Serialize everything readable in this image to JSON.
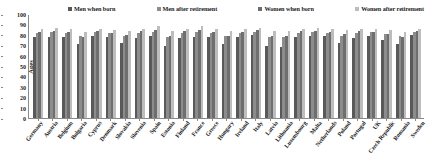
{
  "chart_data": {
    "type": "bar",
    "title": "",
    "xlabel": "",
    "ylabel": "Ages",
    "ylim": [
      0,
      100
    ],
    "yticks": [
      100,
      90,
      80,
      70,
      60,
      50,
      40,
      30,
      20,
      10,
      0
    ],
    "grid": false,
    "legend_position": "top",
    "categories": [
      "Germany",
      "Austria",
      "Belgium",
      "Bulgaria",
      "Cyprus",
      "Denmark",
      "Slovakia",
      "Slovenia",
      "Spain",
      "Estonia",
      "Finland",
      "France",
      "Greece",
      "Hungary",
      "Ireland",
      "Italy",
      "Latvia",
      "Lithuania",
      "Luxembourg",
      "Malta",
      "Netherlands",
      "Poland",
      "Portugal",
      "UK",
      "Czech Republic",
      "Romania",
      "Sweden"
    ],
    "series": [
      {
        "name": "Men when born",
        "color": "#595959",
        "values": [
          78,
          78,
          78,
          71,
          79,
          78,
          72,
          77,
          79,
          69,
          77,
          78,
          78,
          71,
          78,
          80,
          69,
          68,
          78,
          79,
          79,
          72,
          77,
          79,
          75,
          71,
          80
        ]
      },
      {
        "name": "Men after retirement",
        "color": "#8c8c8c",
        "values": [
          82,
          83,
          82,
          79,
          83,
          82,
          79,
          82,
          83,
          78,
          82,
          83,
          82,
          79,
          82,
          83,
          78,
          78,
          82,
          83,
          82,
          79,
          82,
          83,
          81,
          79,
          83
        ]
      },
      {
        "name": "Women when born",
        "color": "#6e6e6e",
        "values": [
          83,
          84,
          83,
          78,
          84,
          82,
          80,
          84,
          85,
          79,
          84,
          85,
          83,
          79,
          83,
          85,
          79,
          79,
          84,
          84,
          83,
          81,
          84,
          83,
          81,
          78,
          84
        ]
      },
      {
        "name": "Women after retirement",
        "color": "#bdbdbd",
        "values": [
          86,
          87,
          86,
          83,
          86,
          85,
          84,
          86,
          88,
          84,
          86,
          88,
          86,
          84,
          86,
          87,
          84,
          84,
          86,
          87,
          86,
          85,
          86,
          86,
          85,
          83,
          86
        ]
      }
    ]
  },
  "legend": {
    "items": [
      {
        "label": "Men when born",
        "color": "#595959"
      },
      {
        "label": "Men after retirement",
        "color": "#8c8c8c"
      },
      {
        "label": "Women when born",
        "color": "#6e6e6e"
      },
      {
        "label": "Women after retirement",
        "color": "#bdbdbd"
      }
    ]
  }
}
